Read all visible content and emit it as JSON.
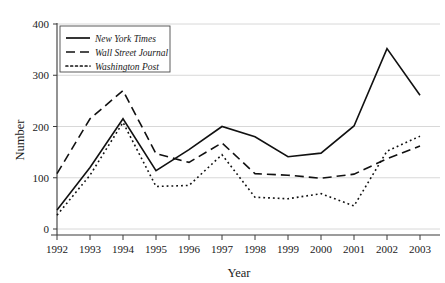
{
  "chart_data": {
    "type": "line",
    "title": "",
    "xlabel": "Year",
    "ylabel": "Number",
    "categories": [
      "1992",
      "1993",
      "1994",
      "1995",
      "1996",
      "1997",
      "1998",
      "1999",
      "2000",
      "2001",
      "2002",
      "2003"
    ],
    "x": [
      1992,
      1993,
      1994,
      1995,
      1996,
      1997,
      1998,
      1999,
      2000,
      2001,
      2002,
      2003
    ],
    "xlim": [
      1992,
      2003
    ],
    "ylim": [
      0,
      400
    ],
    "yticks": [
      0,
      100,
      200,
      300,
      400
    ],
    "ytick_labels": [
      "0",
      "100",
      "200",
      "300",
      "400"
    ],
    "grid": "horizontal",
    "legend_position": "top-left",
    "series": [
      {
        "name": "New York Times",
        "style": "solid",
        "values": [
          37,
          120,
          215,
          114,
          155,
          200,
          180,
          141,
          148,
          201,
          352,
          261
        ]
      },
      {
        "name": "Wall Street Journal",
        "style": "dashed",
        "values": [
          108,
          215,
          270,
          147,
          130,
          168,
          108,
          105,
          99,
          107,
          137,
          162
        ]
      },
      {
        "name": "Washington Post",
        "style": "dotted",
        "values": [
          27,
          105,
          208,
          83,
          85,
          145,
          62,
          59,
          69,
          45,
          152,
          181
        ]
      }
    ]
  },
  "axes": {
    "y_title": "Number",
    "x_title": "Year"
  },
  "legend": {
    "entries": [
      {
        "label": "New York Times",
        "style": "solid"
      },
      {
        "label": "Wall Street Journal",
        "style": "dashed"
      },
      {
        "label": "Washington Post",
        "style": "dotted"
      }
    ]
  }
}
